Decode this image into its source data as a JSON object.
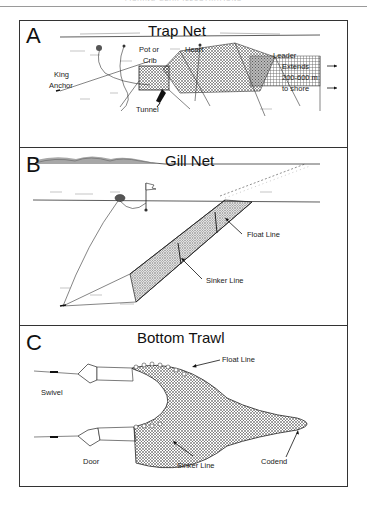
{
  "header": {
    "text": "FISHING GEAR ILLUSTRATIONS"
  },
  "panels": [
    {
      "letter": "A",
      "title": "Trap Net",
      "labels": {
        "king_anchor_1": "King",
        "king_anchor_2": "Anchor",
        "pot_1": "Pot or",
        "pot_2": "Crib",
        "heart": "Heart",
        "leader": "Leader",
        "extends_1": "Extends",
        "extends_2": "200-600 m",
        "extends_3": "to shore",
        "tunnel": "Tunnel"
      }
    },
    {
      "letter": "B",
      "title": "Gill Net",
      "labels": {
        "float_line": "Float Line",
        "sinker_line": "Sinker Line"
      }
    },
    {
      "letter": "C",
      "title": "Bottom Trawl",
      "labels": {
        "swivel": "Swivel",
        "float_line": "Float Line",
        "door": "Door",
        "sinker_line": "Sinker Line",
        "codend": "Codend"
      }
    }
  ],
  "colors": {
    "ink": "#111111",
    "frame": "#333333",
    "net": "#555555"
  }
}
